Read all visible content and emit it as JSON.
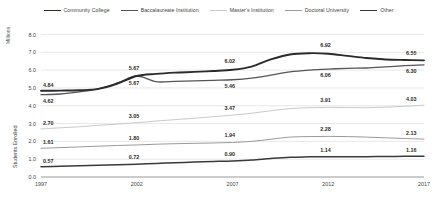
{
  "legend": {
    "items": [
      {
        "label": "Community College",
        "color": "#2b2b2b",
        "width": 1.9
      },
      {
        "label": "Baccalaureate Institution",
        "color": "#555555",
        "width": 1.3
      },
      {
        "label": "Master's Institution",
        "color": "#c9c9c9",
        "width": 1.0
      },
      {
        "label": "Doctoral University",
        "color": "#9a9a9a",
        "width": 1.0
      },
      {
        "label": "Other",
        "color": "#3a3a3a",
        "width": 1.5
      }
    ]
  },
  "axes": {
    "y_unit": "Millions",
    "y_title": "Students Enrolled",
    "y_ticks": [
      "0.0",
      "1.0",
      "2.0",
      "3.0",
      "4.0",
      "5.0",
      "6.0",
      "7.0",
      "8.0"
    ],
    "x_ticks": [
      "1997",
      "2002",
      "2007",
      "2012",
      "2017"
    ]
  },
  "chart_data": {
    "type": "line",
    "title": "",
    "xlabel": "",
    "ylabel": "Students Enrolled",
    "y_unit": "Millions",
    "ylim": [
      0.0,
      8.0
    ],
    "xlim": [
      1997,
      2017
    ],
    "grid": true,
    "legend_position": "top",
    "x": [
      1997,
      1998,
      1999,
      2000,
      2001,
      2002,
      2003,
      2004,
      2005,
      2006,
      2007,
      2008,
      2009,
      2010,
      2011,
      2012,
      2013,
      2014,
      2015,
      2016,
      2017
    ],
    "series": [
      {
        "name": "Community College",
        "color": "#2b2b2b",
        "values": [
          4.84,
          4.85,
          4.87,
          4.95,
          5.25,
          5.67,
          5.79,
          5.86,
          5.9,
          5.95,
          6.02,
          6.2,
          6.6,
          6.88,
          6.95,
          6.92,
          6.8,
          6.68,
          6.6,
          6.57,
          6.55
        ],
        "labels": [
          {
            "x": 1997,
            "value": "4.84"
          },
          {
            "x": 2002,
            "value": "5.67"
          },
          {
            "x": 2007,
            "value": "6.02"
          },
          {
            "x": 2012,
            "value": "6.92"
          },
          {
            "x": 2017,
            "value": "6.55"
          }
        ]
      },
      {
        "name": "Baccalaureate Institution",
        "color": "#555555",
        "values": [
          4.62,
          4.66,
          4.78,
          4.95,
          5.28,
          5.67,
          5.35,
          5.37,
          5.4,
          5.43,
          5.46,
          5.55,
          5.72,
          5.9,
          6.0,
          6.06,
          6.1,
          6.12,
          6.18,
          6.25,
          6.3
        ],
        "labels": [
          {
            "x": 1997,
            "value": "4.62"
          },
          {
            "x": 2002,
            "value": "5.67"
          },
          {
            "x": 2007,
            "value": "5.46"
          },
          {
            "x": 2012,
            "value": "6.06"
          },
          {
            "x": 2017,
            "value": "6.30"
          }
        ]
      },
      {
        "name": "Master's Institution",
        "color": "#c9c9c9",
        "values": [
          2.7,
          2.76,
          2.82,
          2.9,
          2.97,
          3.05,
          3.14,
          3.22,
          3.3,
          3.39,
          3.47,
          3.58,
          3.72,
          3.84,
          3.89,
          3.91,
          3.9,
          3.89,
          3.92,
          3.97,
          4.03
        ],
        "labels": [
          {
            "x": 1997,
            "value": "2.70"
          },
          {
            "x": 2002,
            "value": "3.05"
          },
          {
            "x": 2007,
            "value": "3.47"
          },
          {
            "x": 2012,
            "value": "3.91"
          },
          {
            "x": 2017,
            "value": "4.03"
          }
        ]
      },
      {
        "name": "Doctoral University",
        "color": "#9a9a9a",
        "values": [
          1.61,
          1.65,
          1.69,
          1.73,
          1.77,
          1.8,
          1.84,
          1.87,
          1.89,
          1.91,
          1.94,
          2.0,
          2.12,
          2.24,
          2.27,
          2.28,
          2.27,
          2.24,
          2.2,
          2.16,
          2.13
        ],
        "labels": [
          {
            "x": 1997,
            "value": "1.61"
          },
          {
            "x": 2002,
            "value": "1.80"
          },
          {
            "x": 2007,
            "value": "1.94"
          },
          {
            "x": 2012,
            "value": "2.28"
          },
          {
            "x": 2017,
            "value": "2.13"
          }
        ]
      },
      {
        "name": "Other",
        "color": "#3a3a3a",
        "values": [
          0.57,
          0.6,
          0.63,
          0.66,
          0.69,
          0.72,
          0.76,
          0.8,
          0.84,
          0.87,
          0.9,
          0.95,
          1.04,
          1.11,
          1.13,
          1.14,
          1.14,
          1.14,
          1.15,
          1.16,
          1.16
        ],
        "labels": [
          {
            "x": 1997,
            "value": "0.57"
          },
          {
            "x": 2002,
            "value": "0.72"
          },
          {
            "x": 2007,
            "value": "0.90"
          },
          {
            "x": 2012,
            "value": "1.14"
          },
          {
            "x": 2017,
            "value": "1.16"
          }
        ]
      }
    ]
  }
}
